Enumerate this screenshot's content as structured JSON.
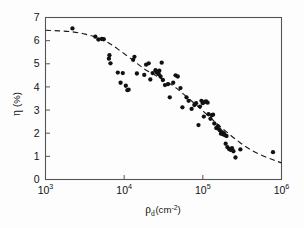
{
  "chart_data": {
    "type": "scatter",
    "title": "",
    "xlabel": "ρ_d(cm⁻²)",
    "xlabel_symbol": "ρ",
    "xlabel_subscript": "d",
    "xlabel_unit": "(cm",
    "xlabel_unit_sup": "-2",
    "xlabel_unit_close": ")",
    "ylabel": "η (%)",
    "ylabel_symbol": "η",
    "ylabel_unit": "(%)",
    "x_scale": "log",
    "y_scale": "linear",
    "xlim": [
      1000,
      1000000
    ],
    "ylim": [
      0,
      7
    ],
    "x_ticks": [
      1000,
      10000,
      100000,
      1000000
    ],
    "x_tick_labels": [
      "10",
      "10",
      "10",
      "10"
    ],
    "x_tick_exponents": [
      "3",
      "4",
      "5",
      "6"
    ],
    "y_ticks": [
      0,
      1,
      2,
      3,
      4,
      5,
      6,
      7
    ],
    "y_tick_labels": [
      "0",
      "1",
      "2",
      "3",
      "4",
      "5",
      "6",
      "7"
    ],
    "grid": false,
    "legend": null,
    "tick_direction": "in",
    "frame": true,
    "marker": "filled-circle",
    "marker_color": "#111111",
    "fit_line_style": "dashed",
    "fit_line_color": "#1a1a1a",
    "series": [
      {
        "name": "measured efficiency",
        "points": [
          [
            2200,
            6.53
          ],
          [
            4300,
            6.17
          ],
          [
            4700,
            6.05
          ],
          [
            5200,
            6.07
          ],
          [
            5500,
            6.06
          ],
          [
            6400,
            5.22
          ],
          [
            6500,
            5.37
          ],
          [
            6700,
            5.02
          ],
          [
            8300,
            4.62
          ],
          [
            9000,
            4.18
          ],
          [
            9600,
            4.6
          ],
          [
            10500,
            4.05
          ],
          [
            11000,
            3.86
          ],
          [
            11400,
            3.88
          ],
          [
            13000,
            5.17
          ],
          [
            13500,
            5.3
          ],
          [
            14500,
            4.58
          ],
          [
            18000,
            4.52
          ],
          [
            19000,
            4.96
          ],
          [
            20500,
            5.02
          ],
          [
            21500,
            4.32
          ],
          [
            23000,
            4.6
          ],
          [
            25000,
            4.72
          ],
          [
            26000,
            4.62
          ],
          [
            27000,
            4.66
          ],
          [
            27500,
            4.55
          ],
          [
            28000,
            4.7
          ],
          [
            29000,
            4.45
          ],
          [
            30000,
            5.05
          ],
          [
            31000,
            4.3
          ],
          [
            33000,
            4.08
          ],
          [
            36000,
            4.12
          ],
          [
            38000,
            3.55
          ],
          [
            42000,
            4.18
          ],
          [
            45000,
            4.5
          ],
          [
            48000,
            4.45
          ],
          [
            52000,
            3.95
          ],
          [
            55000,
            3.12
          ],
          [
            62000,
            3.55
          ],
          [
            66000,
            3.4
          ],
          [
            72000,
            3.05
          ],
          [
            78000,
            3.22
          ],
          [
            82000,
            3.3
          ],
          [
            88000,
            2.35
          ],
          [
            92000,
            3.15
          ],
          [
            96000,
            3.4
          ],
          [
            100000,
            3.3
          ],
          [
            103000,
            2.72
          ],
          [
            106000,
            3.35
          ],
          [
            110000,
            3.38
          ],
          [
            115000,
            3.32
          ],
          [
            118000,
            2.82
          ],
          [
            125000,
            2.62
          ],
          [
            130000,
            2.78
          ],
          [
            135000,
            2.8
          ],
          [
            140000,
            2.42
          ],
          [
            148000,
            2.22
          ],
          [
            155000,
            2.3
          ],
          [
            160000,
            2.18
          ],
          [
            165000,
            2.12
          ],
          [
            170000,
            1.98
          ],
          [
            175000,
            2.05
          ],
          [
            180000,
            1.95
          ],
          [
            185000,
            2.0
          ],
          [
            190000,
            1.92
          ],
          [
            195000,
            1.55
          ],
          [
            200000,
            1.88
          ],
          [
            205000,
            1.4
          ],
          [
            215000,
            1.32
          ],
          [
            225000,
            1.28
          ],
          [
            235000,
            1.35
          ],
          [
            245000,
            1.22
          ],
          [
            260000,
            0.95
          ],
          [
            300000,
            1.3
          ],
          [
            780000,
            1.18
          ]
        ]
      }
    ],
    "fit_curve": [
      [
        1000,
        6.45
      ],
      [
        1500,
        6.42
      ],
      [
        2200,
        6.38
      ],
      [
        3200,
        6.28
      ],
      [
        4600,
        6.12
      ],
      [
        6500,
        5.88
      ],
      [
        9000,
        5.55
      ],
      [
        13000,
        5.15
      ],
      [
        18000,
        4.78
      ],
      [
        25000,
        4.5
      ],
      [
        34000,
        4.25
      ],
      [
        46000,
        3.95
      ],
      [
        62000,
        3.58
      ],
      [
        85000,
        3.18
      ],
      [
        115000,
        2.78
      ],
      [
        155000,
        2.38
      ],
      [
        210000,
        2.0
      ],
      [
        290000,
        1.62
      ],
      [
        400000,
        1.3
      ],
      [
        560000,
        1.05
      ],
      [
        780000,
        0.85
      ],
      [
        1000000,
        0.72
      ]
    ]
  }
}
